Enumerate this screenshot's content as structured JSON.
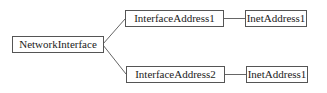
{
  "diagram": {
    "type": "tree",
    "nodes": [
      {
        "id": "ni",
        "label": "NetworkInterface"
      },
      {
        "id": "ia1",
        "label": "InterfaceAddress1"
      },
      {
        "id": "ia2",
        "label": "InterfaceAddress2"
      },
      {
        "id": "inet1a",
        "label": "InetAddress1"
      },
      {
        "id": "inet1b",
        "label": "InetAddress1"
      }
    ],
    "edges": [
      {
        "from": "ni",
        "to": "ia1"
      },
      {
        "from": "ni",
        "to": "ia2"
      },
      {
        "from": "ia1",
        "to": "inet1a"
      },
      {
        "from": "ia2",
        "to": "inet1b"
      }
    ],
    "colors": {
      "border": "#555555",
      "line": "#666666",
      "text": "#222222",
      "background": "#ffffff"
    }
  }
}
